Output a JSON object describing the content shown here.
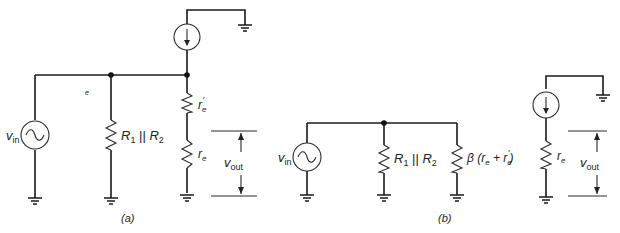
{
  "figure": {
    "panels": [
      {
        "id": "a",
        "caption": "(a)",
        "labels": {
          "source": "v",
          "source_sub": "in",
          "node_label": "e",
          "resistor_parallel": "R",
          "resistor_parallel_sub1": "1",
          "resistor_parallel_sep": " || ",
          "resistor_parallel_2": "R",
          "resistor_parallel_sub2": "2",
          "resistor_top": "r",
          "resistor_top_sub": "e",
          "resistor_top_prime": "′",
          "resistor_bottom": "r",
          "resistor_bottom_sub": "e",
          "output": "v",
          "output_sub": "out"
        },
        "components": [
          "ac-voltage-source",
          "resistor R1||R2",
          "current-source",
          "resistor r'e",
          "resistor re",
          "ground x4"
        ]
      },
      {
        "id": "b",
        "caption": "(b)",
        "labels": {
          "source": "v",
          "source_sub": "in",
          "resistor_parallel": "R",
          "resistor_parallel_sub1": "1",
          "resistor_parallel_sep": " || ",
          "resistor_parallel_2": "R",
          "resistor_parallel_sub2": "2",
          "input_impedance": "β (r",
          "input_impedance_sub1": "e",
          "input_impedance_mid": " + r",
          "input_impedance_sub2": "e",
          "input_impedance_prime": "′",
          "input_impedance_end": ")",
          "output_resistor": "r",
          "output_resistor_sub": "e",
          "output": "v",
          "output_sub": "out"
        },
        "components": [
          "ac-voltage-source",
          "resistor R1||R2",
          "resistor β(re + r'e)",
          "current-source",
          "resistor re",
          "ground x5"
        ]
      }
    ]
  }
}
